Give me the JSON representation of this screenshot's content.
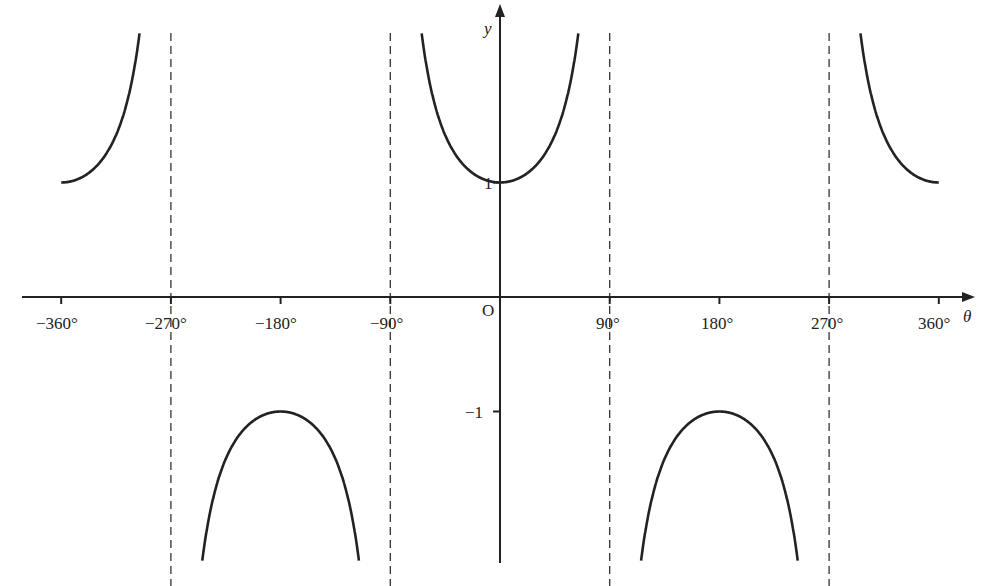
{
  "chart_data": {
    "type": "line",
    "title": "",
    "function": "y = sec θ",
    "xlabel": "θ",
    "ylabel": "y",
    "origin_label": "O",
    "x_ticks": [
      -360,
      -270,
      -180,
      -90,
      90,
      180,
      270,
      360
    ],
    "x_tick_labels": [
      "−360°",
      "−270°",
      "−180°",
      "−90°",
      "90°",
      "180°",
      "270°",
      "360°"
    ],
    "y_ticks": [
      1,
      -1
    ],
    "y_tick_labels": [
      "1",
      "−1"
    ],
    "xlim": [
      -375,
      380
    ],
    "ylim": [
      -2.3,
      2.6
    ],
    "asymptotes": [
      -270,
      -90,
      90,
      270
    ],
    "grid": false,
    "legend": null,
    "series": [
      {
        "name": "sec θ branch 1",
        "x_range": [
          -360,
          -270
        ],
        "values_note": "from 1 at −360° rising to +∞ near −270°"
      },
      {
        "name": "sec θ branch 2",
        "x_range": [
          -270,
          -90
        ],
        "values_note": "from −∞ up to max −1 at −180° then down to −∞"
      },
      {
        "name": "sec θ branch 3",
        "x_range": [
          -90,
          90
        ],
        "values_note": "from +∞ down to min 1 at 0° then up to +∞"
      },
      {
        "name": "sec θ branch 4",
        "x_range": [
          90,
          270
        ],
        "values_note": "from −∞ up to max −1 at 180° then down to −∞"
      },
      {
        "name": "sec θ branch 5",
        "x_range": [
          270,
          360
        ],
        "values_note": "from +∞ down to 1 at 360°"
      }
    ],
    "key_points": [
      {
        "x": -360,
        "y": 1
      },
      {
        "x": -180,
        "y": -1
      },
      {
        "x": 0,
        "y": 1
      },
      {
        "x": 180,
        "y": -1
      },
      {
        "x": 360,
        "y": 1
      }
    ]
  }
}
